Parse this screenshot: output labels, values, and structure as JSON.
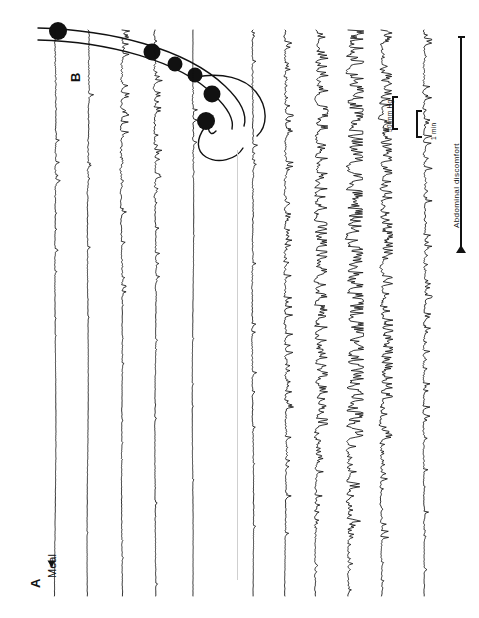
{
  "figure": {
    "orientation": "rotated-90",
    "ink_color": "#111111",
    "background": "#ffffff"
  },
  "panels": [
    {
      "id": "A",
      "label": "A",
      "description": "multichannel gastrointestinal manometry pressure recording"
    },
    {
      "id": "B",
      "label": "B",
      "description": "schematic of catheter sensor positions along the gut"
    }
  ],
  "annotations": {
    "meal_marker": {
      "label": "Meal",
      "icon": "arrow-marker-icon"
    },
    "pressure_scale": {
      "label": "50 mm Hg",
      "value": 50,
      "unit": "mm Hg"
    },
    "time_scale": {
      "label": "1 min",
      "value": 1,
      "unit": "min"
    },
    "event_bar": {
      "label": "Abdominal discomfort",
      "icon": "double-arrow-icon"
    }
  },
  "chart_data": {
    "type": "line",
    "title": "",
    "xlabel": "Time",
    "ylabel": "Pressure (mm Hg)",
    "scalebars": {
      "pressure": "50 mm Hg",
      "time": "1 min"
    },
    "event_markers": [
      {
        "name": "Meal",
        "panel": "A"
      },
      {
        "name": "Abdominal discomfort",
        "panel": "A"
      }
    ],
    "series": [
      {
        "name": "Channel 1",
        "panel": "A",
        "group": "fasting",
        "activity": "low",
        "baseline_x": 55
      },
      {
        "name": "Channel 2",
        "panel": "A",
        "group": "fasting",
        "activity": "low",
        "baseline_x": 88
      },
      {
        "name": "Channel 3",
        "panel": "A",
        "group": "fasting",
        "activity": "moderate",
        "baseline_x": 122
      },
      {
        "name": "Channel 4",
        "panel": "A",
        "group": "fasting",
        "activity": "moderate",
        "baseline_x": 155
      },
      {
        "name": "Channel 5",
        "panel": "A",
        "group": "fasting",
        "activity": "burst",
        "baseline_x": 193
      },
      {
        "name": "Channel 6",
        "panel": "A",
        "group": "postprand",
        "activity": "low",
        "baseline_x": 253
      },
      {
        "name": "Channel 7",
        "panel": "A",
        "group": "postprand",
        "activity": "moderate",
        "baseline_x": 285
      },
      {
        "name": "Channel 8",
        "panel": "A",
        "group": "postprand",
        "activity": "high",
        "baseline_x": 316
      },
      {
        "name": "Channel 9",
        "panel": "A",
        "group": "postprand",
        "activity": "very-high",
        "baseline_x": 348
      },
      {
        "name": "Channel 10",
        "panel": "A",
        "group": "postprand",
        "activity": "high",
        "baseline_x": 381
      },
      {
        "name": "Channel 11",
        "panel": "A",
        "group": "postprand",
        "activity": "moderate",
        "baseline_x": 424
      }
    ]
  },
  "schematic": {
    "sensor_count": 6,
    "sensor_shape": "filled-circle",
    "tube": "double-line-curve"
  }
}
